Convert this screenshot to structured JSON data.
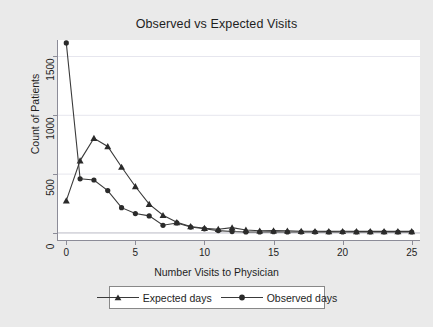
{
  "chart_data": {
    "type": "line",
    "title": "Observed vs Expected Visits",
    "xlabel": "Number Visits to Physician",
    "ylabel": "Count of Patients",
    "xlim": [
      -0.6,
      25.6
    ],
    "ylim": [
      -60,
      1640
    ],
    "xticks": [
      0,
      5,
      10,
      15,
      20,
      25
    ],
    "yticks": [
      0,
      500,
      1000,
      1500
    ],
    "grid": "horizontal",
    "legend_position": "below",
    "x": [
      0,
      1,
      2,
      3,
      4,
      5,
      6,
      7,
      8,
      9,
      10,
      11,
      12,
      13,
      14,
      15,
      16,
      17,
      18,
      19,
      20,
      21,
      22,
      23,
      24,
      25
    ],
    "series": [
      {
        "name": "Expected days",
        "marker": "triangle",
        "color": "#3a3a3a",
        "values": [
          275,
          615,
          805,
          735,
          560,
          395,
          245,
          150,
          90,
          55,
          40,
          32,
          45,
          25,
          18,
          20,
          18,
          15,
          14,
          13,
          14,
          13,
          13,
          13,
          13,
          13
        ]
      },
      {
        "name": "Observed days",
        "marker": "circle",
        "color": "#3a3a3a",
        "values": [
          1615,
          460,
          450,
          360,
          215,
          165,
          145,
          65,
          85,
          50,
          35,
          20,
          12,
          8,
          8,
          10,
          8,
          8,
          8,
          8,
          8,
          8,
          8,
          8,
          8,
          8
        ]
      }
    ]
  },
  "axis": {
    "y_tick_labels": [
      "0",
      "500",
      "1000",
      "1500"
    ],
    "x_tick_labels": [
      "0",
      "5",
      "10",
      "15",
      "20",
      "25"
    ]
  },
  "legend": {
    "entries": [
      {
        "label": "Expected days",
        "marker": "triangle-icon"
      },
      {
        "label": "Observed days",
        "marker": "circle-icon"
      }
    ]
  }
}
